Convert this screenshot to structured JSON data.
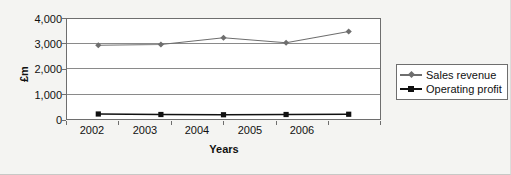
{
  "chart_data": {
    "type": "line",
    "title": "",
    "xlabel": "Years",
    "ylabel": "£m",
    "categories": [
      "2002",
      "2003",
      "2004",
      "2005",
      "2006"
    ],
    "ylim": [
      0,
      4000
    ],
    "yticks": [
      "0",
      "1,000",
      "2,000",
      "3,000",
      "4,000"
    ],
    "ytick_values": [
      0,
      1000,
      2000,
      3000,
      4000
    ],
    "grid": true,
    "legend_position": "right",
    "series": [
      {
        "name": "Sales revenue",
        "values": [
          2950,
          2980,
          3250,
          3050,
          3500
        ],
        "color": "#6e6e6e",
        "marker": "diamond"
      },
      {
        "name": "Operating profit",
        "values": [
          200,
          180,
          170,
          180,
          190
        ],
        "color": "#111111",
        "marker": "square"
      }
    ]
  }
}
